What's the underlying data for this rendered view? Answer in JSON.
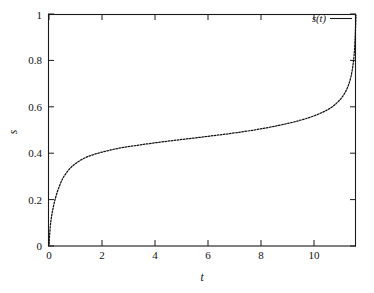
{
  "figure": {
    "background_color": "#ffffff",
    "frame_color": "#1a1a1a",
    "curve_color": "#111111"
  },
  "axes": {
    "x_title": "t",
    "y_title": "s",
    "x_ticks": [
      "0",
      "2",
      "4",
      "6",
      "8",
      "10"
    ],
    "y_ticks": [
      "0",
      "0.2",
      "0.4",
      "0.6",
      "0.8",
      "1"
    ]
  },
  "legend": {
    "entries": [
      {
        "label": "s(t)",
        "style": "line"
      }
    ]
  },
  "chart_data": {
    "type": "line",
    "title": "",
    "subtitle": "",
    "xlabel": "t",
    "ylabel": "s",
    "xlim": [
      0,
      11.62
    ],
    "ylim": [
      0,
      1
    ],
    "xticks": [
      0,
      2,
      4,
      6,
      8,
      10
    ],
    "yticks": [
      0,
      0.2,
      0.4,
      0.6,
      0.8,
      1
    ],
    "grid": false,
    "legend_position": "top-right-inside",
    "annotations": [],
    "series": [
      {
        "name": "s(t)",
        "line_style": "dotted",
        "color": "#111111",
        "x": [
          0.0,
          0.05,
          0.1,
          0.16,
          0.22,
          0.3,
          0.4,
          0.52,
          0.66,
          0.82,
          1.0,
          1.2,
          1.42,
          1.66,
          1.92,
          2.2,
          2.5,
          2.82,
          3.16,
          3.52,
          3.9,
          4.3,
          4.72,
          5.16,
          5.62,
          6.1,
          6.6,
          7.12,
          7.66,
          8.22,
          8.7,
          9.1,
          9.45,
          9.78,
          10.08,
          10.35,
          10.6,
          10.84,
          11.04,
          11.2,
          11.33,
          11.43,
          11.5,
          11.55,
          11.58,
          11.6,
          11.62
        ],
        "y": [
          0.01,
          0.085,
          0.13,
          0.166,
          0.196,
          0.228,
          0.26,
          0.291,
          0.316,
          0.337,
          0.355,
          0.37,
          0.383,
          0.393,
          0.402,
          0.41,
          0.418,
          0.425,
          0.431,
          0.437,
          0.443,
          0.449,
          0.455,
          0.461,
          0.467,
          0.474,
          0.481,
          0.489,
          0.498,
          0.509,
          0.52,
          0.53,
          0.54,
          0.551,
          0.563,
          0.576,
          0.591,
          0.611,
          0.634,
          0.66,
          0.692,
          0.73,
          0.775,
          0.825,
          0.88,
          0.935,
          0.995
        ]
      }
    ]
  }
}
